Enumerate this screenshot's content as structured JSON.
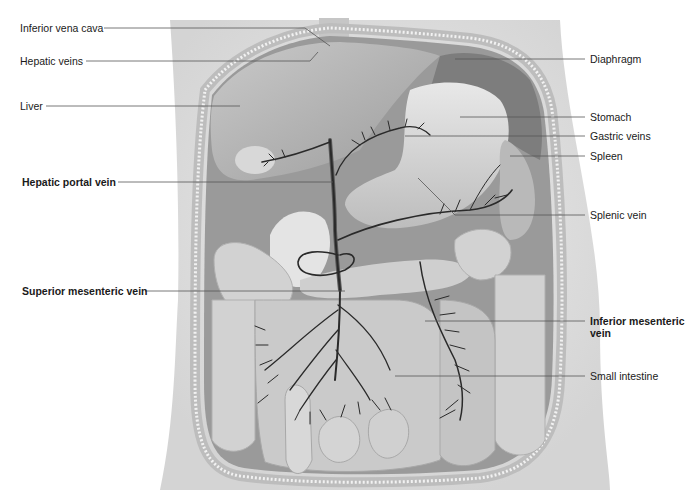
{
  "diagram": {
    "colors": {
      "background": "#ffffff",
      "body_skin": "#e4e4e4",
      "body_wall": "#c9c9c9",
      "organ_light": "#d6d6d6",
      "organ_dark": "#8e8e8e",
      "vein": "#2a2a2a",
      "leader_line": "#555555",
      "text": "#1a1a1a"
    },
    "labels_left": [
      {
        "id": "ivc",
        "text": "Inferior vena cava",
        "bold": false
      },
      {
        "id": "hepatic-veins",
        "text": "Hepatic veins",
        "bold": false
      },
      {
        "id": "liver",
        "text": "Liver",
        "bold": false
      },
      {
        "id": "hepatic-portal-vein",
        "text": "Hepatic portal vein",
        "bold": true
      },
      {
        "id": "superior-mesenteric-vein",
        "text": "Superior mesenteric vein",
        "bold": true
      }
    ],
    "labels_right": [
      {
        "id": "diaphragm",
        "text": "Diaphragm",
        "bold": false
      },
      {
        "id": "stomach",
        "text": "Stomach",
        "bold": false
      },
      {
        "id": "gastric-veins",
        "text": "Gastric veins",
        "bold": false
      },
      {
        "id": "spleen",
        "text": "Spleen",
        "bold": false
      },
      {
        "id": "splenic-vein",
        "text": "Splenic vein",
        "bold": false
      },
      {
        "id": "inferior-mesenteric-vein",
        "text": "Inferior mesenteric vein",
        "bold": true
      },
      {
        "id": "small-intestine",
        "text": "Small intestine",
        "bold": false
      }
    ]
  }
}
